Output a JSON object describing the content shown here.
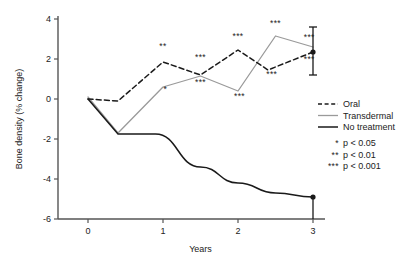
{
  "chart_data": {
    "type": "line",
    "title": "",
    "xlabel": "Years",
    "ylabel": "Bone density (% change)",
    "xlim": [
      -0.18,
      3.18
    ],
    "ylim": [
      -6,
      4
    ],
    "xticks": [
      0,
      1,
      2,
      3
    ],
    "xtick_labels": [
      "0",
      "1",
      "2",
      "3"
    ],
    "yticks": [
      -6,
      -4,
      -2,
      0,
      2,
      4
    ],
    "ytick_labels": [
      "-6",
      "-4",
      "-2",
      "0",
      "2",
      "4"
    ],
    "grid": false,
    "legend_position": "right",
    "series": [
      {
        "name": "Oral",
        "style": "dashed",
        "color": "#1a1a1a",
        "x": [
          0,
          0.4,
          1,
          1.5,
          2,
          2.4,
          3
        ],
        "values": [
          0,
          -0.1,
          1.85,
          1.2,
          2.45,
          1.45,
          2.35
        ]
      },
      {
        "name": "Transdermal",
        "style": "solid-gray",
        "color": "#9a9a9a",
        "x": [
          0,
          0.4,
          1,
          1.5,
          2,
          2.5,
          3
        ],
        "values": [
          0.1,
          -1.7,
          0.6,
          1.15,
          0.4,
          3.15,
          2.6
        ]
      },
      {
        "name": "No treatment",
        "style": "solid",
        "color": "#1a1a1a",
        "x": [
          0,
          0.4,
          0.9,
          1.5,
          2,
          2.5,
          3
        ],
        "values": [
          0,
          -1.75,
          -1.75,
          -3.4,
          -4.2,
          -4.7,
          -4.9
        ]
      }
    ],
    "error_bars": [
      {
        "series": "endpoint",
        "x": 3,
        "y": 2.35,
        "low": 1.2,
        "high": 3.6
      },
      {
        "series": "No treatment",
        "x": 3,
        "y": -4.9,
        "low": -6.0,
        "high": -4.9
      }
    ],
    "annotations": [
      {
        "text": "**",
        "x": 1.0,
        "y": 2.5,
        "series": "Oral"
      },
      {
        "text": "***",
        "x": 1.5,
        "y": 1.95,
        "series": "Oral"
      },
      {
        "text": "***",
        "x": 2.0,
        "y": 3.0,
        "series": "Oral"
      },
      {
        "text": "***",
        "x": 2.5,
        "y": 3.65,
        "series": "Transdermal"
      },
      {
        "text": "***",
        "x": 2.95,
        "y": 2.95,
        "series": "Oral"
      },
      {
        "text": "*",
        "x": 1.03,
        "y": 0.35,
        "series": "Transdermal"
      },
      {
        "text": "***",
        "x": 1.5,
        "y": 0.72,
        "series": "Transdermal"
      },
      {
        "text": "***",
        "x": 2.02,
        "y": 0.0,
        "series": "Transdermal"
      },
      {
        "text": "***",
        "x": 2.45,
        "y": 1.1,
        "series": "Transdermal"
      },
      {
        "text": "***",
        "x": 2.95,
        "y": 1.85,
        "series": "Transdermal"
      }
    ],
    "legend": [
      {
        "label": "Oral",
        "style": "dashed",
        "color": "#1a1a1a"
      },
      {
        "label": "Transdermal",
        "style": "solid-gray",
        "color": "#9a9a9a"
      },
      {
        "label": "No treatment",
        "style": "solid",
        "color": "#1a1a1a"
      }
    ],
    "significance_key": [
      {
        "symbol": "*",
        "label": "p < 0.05"
      },
      {
        "symbol": "**",
        "label": "p < 0.01"
      },
      {
        "symbol": "***",
        "label": "p < 0.001"
      }
    ]
  }
}
